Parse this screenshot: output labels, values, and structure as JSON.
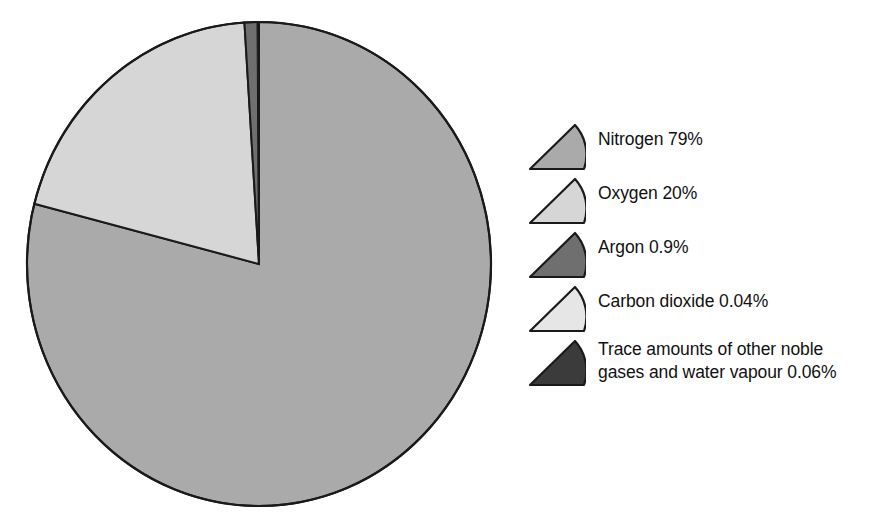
{
  "chart_data": {
    "type": "pie",
    "title": "",
    "subtitle": "",
    "xlabel": "",
    "ylabel": "",
    "grid": false,
    "legend_position": "right",
    "start_angle_deg": 0,
    "direction": "clockwise",
    "categories": [
      "Nitrogen",
      "Oxygen",
      "Argon",
      "Carbon dioxide",
      "Trace amounts of other noble gases and water vapour"
    ],
    "values": [
      79,
      20,
      0.9,
      0.04,
      0.06
    ],
    "value_labels": [
      "79%",
      "20%",
      "0.9%",
      "0.04%",
      "0.06%"
    ],
    "colors": [
      "#aaaaaa",
      "#d6d6d6",
      "#6f6f6f",
      "#e6e6e6",
      "#3b3b3b"
    ],
    "stroke_color": "#1a1a1a",
    "slices": [
      {
        "name": "Nitrogen",
        "value": 79,
        "percent": "79%",
        "color": "#aaaaaa",
        "start_deg": 0,
        "end_deg": 284.4
      },
      {
        "name": "Oxygen",
        "value": 20,
        "percent": "20%",
        "color": "#d6d6d6",
        "start_deg": 284.4,
        "end_deg": 356.4
      },
      {
        "name": "Argon",
        "value": 0.9,
        "percent": "0.9%",
        "color": "#6f6f6f",
        "start_deg": 356.4,
        "end_deg": 359.64
      },
      {
        "name": "Carbon dioxide",
        "value": 0.04,
        "percent": "0.04%",
        "color": "#e6e6e6",
        "start_deg": 359.64,
        "end_deg": 359.784
      },
      {
        "name": "Trace",
        "value": 0.06,
        "percent": "0.06%",
        "color": "#3b3b3b",
        "start_deg": 359.784,
        "end_deg": 360
      }
    ]
  },
  "legend": {
    "items": [
      {
        "label": "Nitrogen 79%",
        "color": "#aaaaaa",
        "swatch_name": "legend-swatch-nitrogen"
      },
      {
        "label": "Oxygen 20%",
        "color": "#d6d6d6",
        "swatch_name": "legend-swatch-oxygen"
      },
      {
        "label": "Argon 0.9%",
        "color": "#6f6f6f",
        "swatch_name": "legend-swatch-argon"
      },
      {
        "label": "Carbon dioxide 0.04%",
        "color": "#e6e6e6",
        "swatch_name": "legend-swatch-carbon-dioxide"
      },
      {
        "label": "Trace amounts of other noble\ngases and water vapour 0.06%",
        "color": "#3b3b3b",
        "swatch_name": "legend-swatch-trace"
      }
    ]
  },
  "style": {
    "background": "#ffffff",
    "text_color": "#111111",
    "outline_color": "#1a1a1a"
  }
}
